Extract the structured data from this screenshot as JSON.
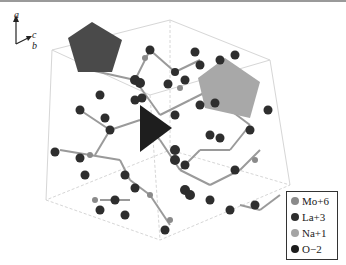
{
  "axes": {
    "a": "a",
    "b": "b",
    "c": "c"
  },
  "legend": {
    "items": [
      {
        "label": "Mo+6",
        "color": "#8a8a8a"
      },
      {
        "label": "La+3",
        "color": "#2e2e2e"
      },
      {
        "label": "Na+1",
        "color": "#a4a4a4"
      },
      {
        "label": "O−2",
        "color": "#1c1c1c"
      }
    ]
  },
  "colors": {
    "dark_polyhedron": "#4a4a4a",
    "light_polyhedron": "#a8a8a8",
    "bond": "#9a9a9a",
    "cell_edge": "#d4d4d4"
  }
}
